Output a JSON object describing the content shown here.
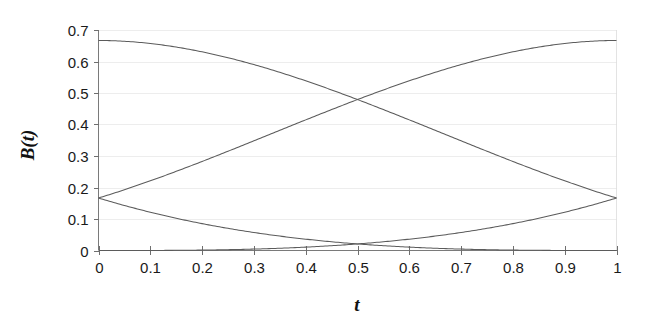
{
  "chart_data": {
    "type": "line",
    "title": "",
    "subtitle": "",
    "xlabel": "t",
    "ylabel": "B(t)",
    "xlim": [
      0,
      1
    ],
    "ylim": [
      0,
      0.7
    ],
    "grid": true,
    "legend": "none",
    "background_color": "#ffffff",
    "curve_color": "#5b5b5b",
    "axis_color": "#7a7a7a",
    "gridline_color": "#e9e9e9",
    "x_ticks": [
      0,
      0.1,
      0.2,
      0.3,
      0.4,
      0.5,
      0.6,
      0.7,
      0.8,
      0.9,
      1
    ],
    "x_tick_labels": [
      "0",
      "0.1",
      "0.2",
      "0.3",
      "0.4",
      "0.5",
      "0.6",
      "0.7",
      "0.8",
      "0.9",
      "1"
    ],
    "y_ticks": [
      0,
      0.1,
      0.2,
      0.3,
      0.4,
      0.5,
      0.6,
      0.7
    ],
    "y_tick_labels": [
      "0",
      "0.1",
      "0.2",
      "0.3",
      "0.4",
      "0.5",
      "0.6",
      "0.7"
    ],
    "x": [
      0,
      0.05,
      0.1,
      0.15,
      0.2,
      0.25,
      0.3,
      0.35,
      0.4,
      0.45,
      0.5,
      0.55,
      0.6,
      0.65,
      0.7,
      0.75,
      0.8,
      0.85,
      0.9,
      0.95,
      1
    ],
    "series": [
      {
        "name": "B0",
        "formula": "(1-t)^3/6",
        "values": [
          0.1667,
          0.1429,
          0.1215,
          0.1023,
          0.0853,
          0.0703,
          0.0572,
          0.0458,
          0.036,
          0.0277,
          0.0208,
          0.0152,
          0.0107,
          0.0071,
          0.0045,
          0.0026,
          0.0013,
          0.0006,
          0.0002,
          0.0,
          0.0
        ]
      },
      {
        "name": "B1",
        "formula": "(3t^3 - 6t^2 + 4)/6",
        "values": [
          0.6667,
          0.666,
          0.6615,
          0.6546,
          0.6453,
          0.6328,
          0.6178,
          0.6004,
          0.5813,
          0.5601,
          0.5365,
          0.5118,
          0.4853,
          0.4575,
          0.4288,
          0.3984,
          0.368,
          0.3365,
          0.304,
          0.2718,
          0.2396
        ]
      },
      {
        "name": "B2",
        "formula": "(-3t^3 + 3t^2 + 3t + 1)/6",
        "values": [
          0.1667,
          0.1909,
          0.2152,
          0.2404,
          0.2653,
          0.2904,
          0.3148,
          0.3391,
          0.3627,
          0.3851,
          0.4063,
          0.4268,
          0.4453,
          0.4625,
          0.4778,
          0.4909,
          0.5013,
          0.5091,
          0.514,
          0.516,
          0.5146
        ]
      },
      {
        "name": "B3",
        "formula": "t^3/6",
        "values": [
          0.0,
          0.0,
          0.0002,
          0.0006,
          0.0013,
          0.0026,
          0.0045,
          0.0071,
          0.0107,
          0.0152,
          0.0208,
          0.0277,
          0.036,
          0.0458,
          0.0572,
          0.0703,
          0.0853,
          0.1023,
          0.1215,
          0.1429,
          0.1667
        ]
      }
    ],
    "annotations": [
      {
        "text": "curves cross near t = 0.5, B = 0.48"
      }
    ]
  }
}
